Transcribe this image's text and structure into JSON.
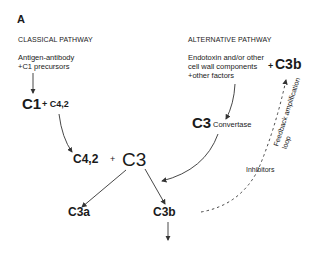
{
  "panel_label": "A",
  "classical": {
    "title": "CLASSICAL PATHWAY",
    "trigger_line1": "Antigen-antibody",
    "trigger_line2": "+C1 precursors",
    "c1": "C1",
    "plus_c42": "+ C4,2",
    "c42": "C4,2",
    "plus": "+",
    "c3": "C3"
  },
  "alternative": {
    "title": "ALTERNATIVE PATHWAY",
    "trigger_line1": "Endotoxin and/or other",
    "trigger_line2": "cell wall components",
    "trigger_line3": "+other factors",
    "plus_c3b": "+",
    "c3b_top": "C3b",
    "c3": "C3",
    "convertase": "Convertase"
  },
  "products": {
    "c3a": "C3a",
    "c3b": "C3b"
  },
  "feedback": {
    "label_line1": "Feedback amplification",
    "label_line2": "loop",
    "inhibitors": "Inhibitors"
  }
}
